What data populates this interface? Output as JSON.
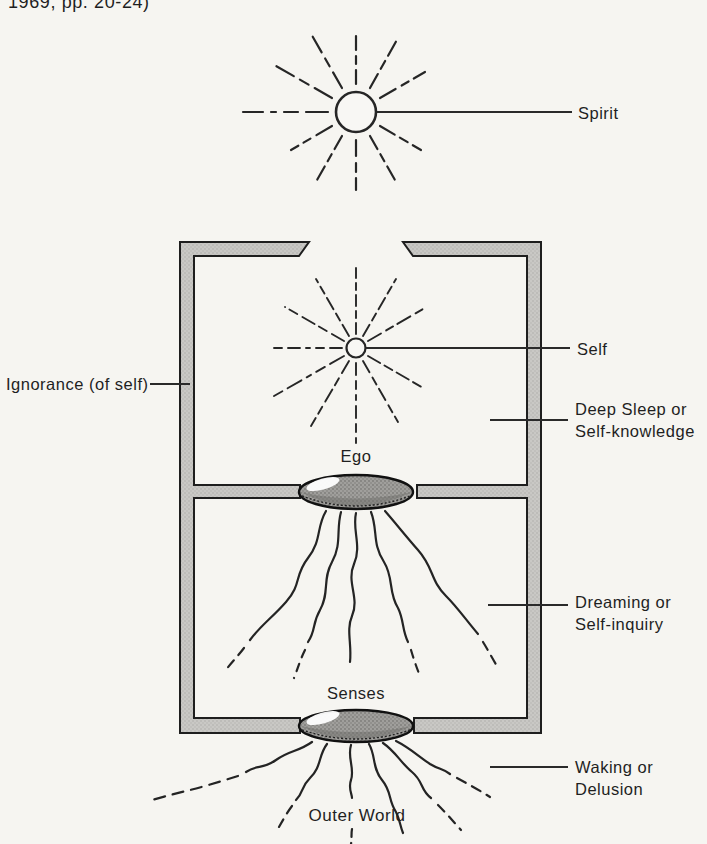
{
  "page": {
    "caption_fragment": "1969, pp. 20-24)"
  },
  "diagram": {
    "labels": {
      "spirit": "Spirit",
      "self": "Self",
      "ego": "Ego",
      "senses": "Senses",
      "outer_world": "Outer World",
      "ignorance": "Ignorance (of self)",
      "deep_sleep_line1": "Deep Sleep or",
      "deep_sleep_line2": "Self-knowledge",
      "dreaming_line1": "Dreaming or",
      "dreaming_line2": "Self-inquiry",
      "waking_line1": "Waking or",
      "waking_line2": "Delusion"
    },
    "icons": {
      "spirit_sun": "radiant-sun-icon",
      "self_sun": "radiant-sun-small-icon",
      "ego_lens": "convex-lens-shape",
      "senses_lens": "convex-lens-shape"
    },
    "colors": {
      "paper": "#f6f5f1",
      "ink": "#1f1f1f",
      "wall_gray": "#c9c8c5",
      "lens_gray": "#a09f9c"
    }
  }
}
